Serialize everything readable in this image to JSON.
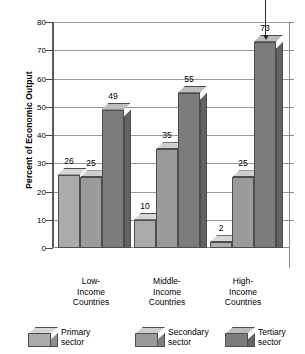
{
  "chart_data": {
    "type": "bar",
    "title": "",
    "xlabel": "",
    "ylabel": "Percent of Economic Output",
    "ylim": [
      0,
      80
    ],
    "yticks": [
      0,
      10,
      20,
      30,
      40,
      50,
      60,
      70,
      80
    ],
    "grid": true,
    "legend_position": "bottom",
    "categories": [
      "Low-\nIncome\nCountries",
      "Middle-\nIncome\nCountries",
      "High-\nIncome\nCountries"
    ],
    "series": [
      {
        "name": "Primary sector",
        "values": [
          26,
          10,
          2
        ]
      },
      {
        "name": "Secondary sector",
        "values": [
          25,
          35,
          25
        ]
      },
      {
        "name": "Tertiary sector",
        "values": [
          49,
          55,
          73
        ]
      }
    ],
    "annotations": [
      {
        "text": "73",
        "target_series": "Tertiary sector",
        "target_category": "High-Income Countries",
        "marker": "down-arrow"
      }
    ]
  },
  "axis": {
    "y_title": "Percent of Economic Output",
    "tick_labels": [
      "80",
      "70",
      "60",
      "50",
      "40",
      "30",
      "20",
      "10",
      "0"
    ]
  },
  "categories": [
    {
      "line1": "Low-",
      "line2": "Income",
      "line3": "Countries"
    },
    {
      "line1": "Middle-",
      "line2": "Income",
      "line3": "Countries"
    },
    {
      "line1": "High-",
      "line2": "Income",
      "line3": "Countries"
    }
  ],
  "bars": [
    {
      "label": "26",
      "value": 26
    },
    {
      "label": "25",
      "value": 25
    },
    {
      "label": "49",
      "value": 49
    },
    {
      "label": "10",
      "value": 10
    },
    {
      "label": "35",
      "value": 35
    },
    {
      "label": "55",
      "value": 55
    },
    {
      "label": "2",
      "value": 2
    },
    {
      "label": "25",
      "value": 25
    },
    {
      "label": "73",
      "value": 73
    }
  ],
  "legend": [
    {
      "line1": "Primary",
      "line2": "sector"
    },
    {
      "line1": "Secondary",
      "line2": "sector"
    },
    {
      "line1": "Tertiary",
      "line2": "sector"
    }
  ],
  "colors": {
    "primary_face": "#ababab",
    "primary_side": "#8e8e8e",
    "primary_top": "#d6d6d6",
    "secondary_face": "#9b9b9b",
    "secondary_side": "#7e7e7e",
    "secondary_top": "#cecece",
    "tertiary_face": "#7c7c7c",
    "tertiary_side": "#636363",
    "tertiary_top": "#bcbcbc",
    "grid": "#9a9a9a",
    "axis": "#4a4a4a",
    "text": "#000000"
  }
}
